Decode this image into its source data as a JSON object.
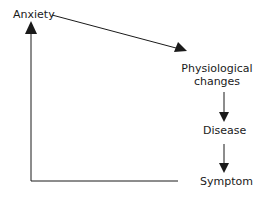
{
  "diagram": {
    "nodes": [
      {
        "id": "anxiety",
        "label": "Anxiety"
      },
      {
        "id": "physiological",
        "label_line1": "Physiological",
        "label_line2": "changes"
      },
      {
        "id": "disease",
        "label": "Disease"
      },
      {
        "id": "symptom",
        "label": "Symptom"
      }
    ],
    "edges": [
      {
        "from": "anxiety",
        "to": "physiological"
      },
      {
        "from": "physiological",
        "to": "disease"
      },
      {
        "from": "disease",
        "to": "symptom"
      },
      {
        "from": "symptom",
        "to": "anxiety"
      }
    ],
    "colors": {
      "line": "#1a1a1a",
      "background": "#ffffff"
    }
  }
}
